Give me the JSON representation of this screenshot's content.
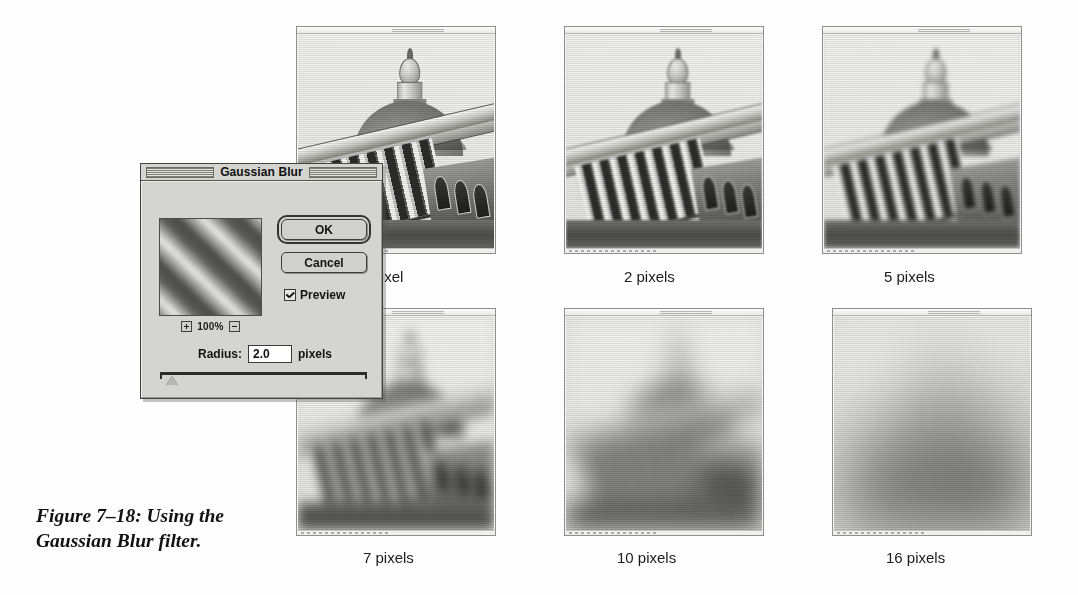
{
  "figure": {
    "caption": "Figure 7–18: Using the Gaussian Blur filter."
  },
  "dialog": {
    "title": "Gaussian Blur",
    "ok_label": "OK",
    "cancel_label": "Cancel",
    "preview_label": "Preview",
    "preview_checked": true,
    "zoom_level": "100%",
    "zoom_in_icon": "plus-icon",
    "zoom_out_icon": "minus-icon",
    "radius_label": "Radius:",
    "radius_value": "2.0",
    "radius_units": "pixels",
    "slider_position_percent": 6
  },
  "samples": [
    {
      "label": "1 pixel",
      "radius": 1,
      "blur_px": 0.5
    },
    {
      "label": "2 pixels",
      "radius": 2,
      "blur_px": 1.1
    },
    {
      "label": "5 pixels",
      "radius": 5,
      "blur_px": 2.0
    },
    {
      "label": "7 pixels",
      "radius": 7,
      "blur_px": 6.0
    },
    {
      "label": "10 pixels",
      "radius": 10,
      "blur_px": 12.0
    },
    {
      "label": "16 pixels",
      "radius": 16,
      "blur_px": 34.0
    }
  ],
  "colors": {
    "page_background": "#ffffff",
    "dialog_face": "#d4d4d0",
    "dialog_border": "#43433f",
    "text": "#111111",
    "photo_light": "#f2f2f0",
    "photo_dark": "#2d2d2c"
  }
}
